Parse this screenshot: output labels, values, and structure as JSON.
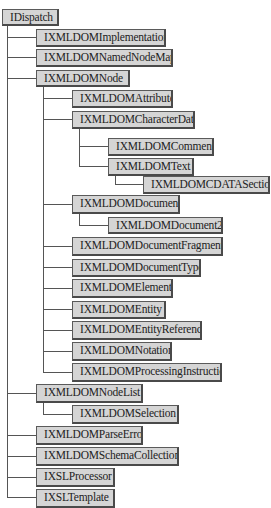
{
  "diagram": {
    "title": "",
    "type": "tree",
    "colors": {
      "box_fill": "#d5d5d5",
      "box_border": "#5a5a5a",
      "line": "#555555",
      "text": "#222222",
      "background": "#ffffff"
    },
    "nodes": [
      {
        "id": "n0",
        "label": "IDispatch",
        "level": 0,
        "parent": null
      },
      {
        "id": "n1",
        "label": "IXMLDOMImplementation",
        "level": 1,
        "parent": "n0"
      },
      {
        "id": "n2",
        "label": "IXMLDOMNamedNodeMap",
        "level": 1,
        "parent": "n0"
      },
      {
        "id": "n3",
        "label": "IXMLDOMNode",
        "level": 1,
        "parent": "n0"
      },
      {
        "id": "n4",
        "label": "IXMLDOMAttribute",
        "level": 2,
        "parent": "n3"
      },
      {
        "id": "n5",
        "label": "IXMLDOMCharacterData",
        "level": 2,
        "parent": "n3"
      },
      {
        "id": "n6",
        "label": "IXMLDOMComment",
        "level": 3,
        "parent": "n5"
      },
      {
        "id": "n7",
        "label": "IXMLDOMText",
        "level": 3,
        "parent": "n5"
      },
      {
        "id": "n8",
        "label": "IXMLDOMCDATASection",
        "level": 4,
        "parent": "n7"
      },
      {
        "id": "n9",
        "label": "IXMLDOMDocument",
        "level": 2,
        "parent": "n3"
      },
      {
        "id": "n10",
        "label": "IXMLDOMDocument2",
        "level": 3,
        "parent": "n9"
      },
      {
        "id": "n11",
        "label": "IXMLDOMDocumentFragment",
        "level": 2,
        "parent": "n3"
      },
      {
        "id": "n12",
        "label": "IXMLDOMDocumentType",
        "level": 2,
        "parent": "n3"
      },
      {
        "id": "n13",
        "label": "IXMLDOMElement",
        "level": 2,
        "parent": "n3"
      },
      {
        "id": "n14",
        "label": "IXMLDOMEntity",
        "level": 2,
        "parent": "n3"
      },
      {
        "id": "n15",
        "label": "IXMLDOMEntityReference",
        "level": 2,
        "parent": "n3"
      },
      {
        "id": "n16",
        "label": "IXMLDOMNotation",
        "level": 2,
        "parent": "n3"
      },
      {
        "id": "n17",
        "label": "IXMLDOMProcessingInstruction",
        "level": 2,
        "parent": "n3"
      },
      {
        "id": "n18",
        "label": "IXMLDOMNodeList",
        "level": 1,
        "parent": "n0"
      },
      {
        "id": "n19",
        "label": "IXMLDOMSelection",
        "level": 2,
        "parent": "n18"
      },
      {
        "id": "n20",
        "label": "IXMLDOMParseError",
        "level": 1,
        "parent": "n0"
      },
      {
        "id": "n21",
        "label": "IXMLDOMSchemaCollection",
        "level": 1,
        "parent": "n0"
      },
      {
        "id": "n22",
        "label": "IXSLProcessor",
        "level": 1,
        "parent": "n0"
      },
      {
        "id": "n23",
        "label": "IXSLTemplate",
        "level": 1,
        "parent": "n0"
      }
    ]
  }
}
